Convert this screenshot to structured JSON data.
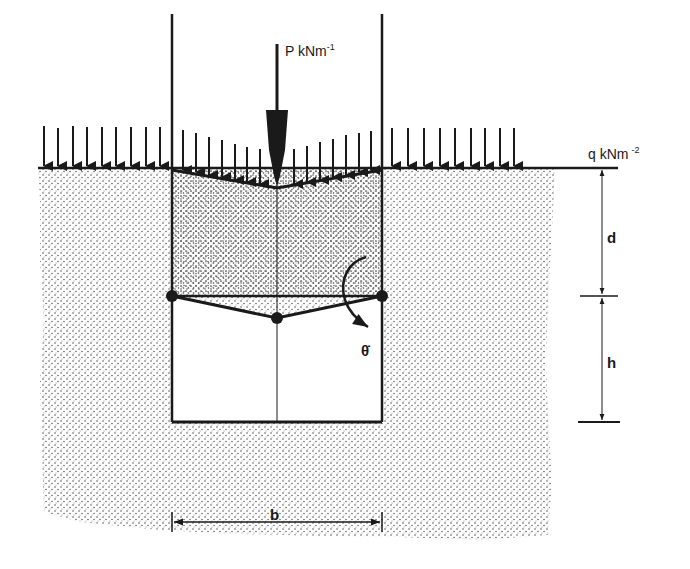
{
  "labels": {
    "point_load": "P kNm",
    "point_load_exp": "-1",
    "surcharge": "q kNm",
    "surcharge_exp": "-2",
    "depth": "d",
    "height": "h",
    "width": "b",
    "rotation": "θ̇"
  },
  "colors": {
    "ink": "#1a1a1a",
    "soil_dot": "#555555",
    "background": "#ffffff"
  },
  "geometry": {
    "surface_y": 168,
    "left_wall_x": 172,
    "right_wall_x": 382,
    "center_x": 277,
    "hinge_y": 296,
    "center_hinge_y": 318,
    "base_y": 422,
    "top_y": 14
  },
  "surcharge_arrows": {
    "left_x": [
      44,
      58,
      73,
      87,
      102,
      116,
      131,
      146,
      160
    ],
    "mid_x": [
      183,
      196,
      209,
      222,
      235,
      247,
      260,
      294,
      307,
      320,
      333,
      346,
      359,
      371
    ],
    "right_x": [
      392,
      408,
      424,
      440,
      455,
      471,
      485,
      500,
      514
    ]
  }
}
